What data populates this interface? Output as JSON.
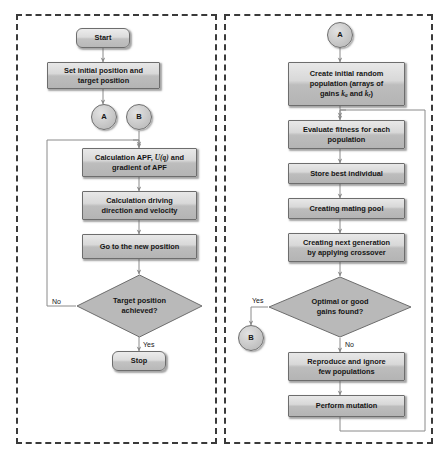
{
  "figure": {
    "caption": "",
    "panels": [
      {
        "id": "left",
        "name": "apf-path-planning-panel"
      },
      {
        "id": "right",
        "name": "genetic-algorithm-panel"
      }
    ]
  },
  "left_panel": {
    "nodes": {
      "start": "Start",
      "set_positions_line1": "Set initial position and",
      "set_positions_line2": "target position",
      "connector_a": "A",
      "connector_b": "B",
      "calc_apf_prefix": "Calculation APF, ",
      "calc_apf_math": "U(q)",
      "calc_apf_suffix": " and",
      "calc_apf_line2": "gradient of APF",
      "calc_driving_line1": "Calculation driving",
      "calc_driving_line2": "direction and velocity",
      "go_new_position": "Go to the new position",
      "decision_line1": "Target position",
      "decision_line2": "achieved?",
      "stop": "Stop"
    },
    "edge_labels": {
      "decision_no": "No",
      "decision_yes": "Yes"
    }
  },
  "right_panel": {
    "nodes": {
      "connector_a": "A",
      "create_pop_line1": "Create initial random",
      "create_pop_line2": "population (arrays of",
      "create_pop_line3_pre": "gains ",
      "create_pop_k1": "k",
      "create_pop_k1_sub": "a",
      "create_pop_line3_mid": " and ",
      "create_pop_k2": "k",
      "create_pop_k2_sub": "r",
      "create_pop_line3_post": ")",
      "evaluate_line1": "Evaluate fitness for each",
      "evaluate_line2": "population",
      "store_best": "Store best individual",
      "mating_pool": "Creating mating pool",
      "next_gen_line1": "Creating next generation",
      "next_gen_line2": "by applying crossover",
      "decision_line1": "Optimal or good",
      "decision_line2": "gains found?",
      "connector_b": "B",
      "reproduce_line1": "Reproduce and ignore",
      "reproduce_line2": "few populations",
      "mutation": "Perform mutation"
    },
    "edge_labels": {
      "decision_yes": "Yes",
      "decision_no": "No"
    }
  },
  "colors": {
    "panel_border": "#3a3a3a",
    "node_border": "#6d6d6d",
    "node_fill_light": "#e8e8e8",
    "node_fill_dark": "#b4b4b4",
    "decision_fill": "#b9b9b9",
    "connector_line": "#7d7d7d",
    "text": "#151515"
  }
}
